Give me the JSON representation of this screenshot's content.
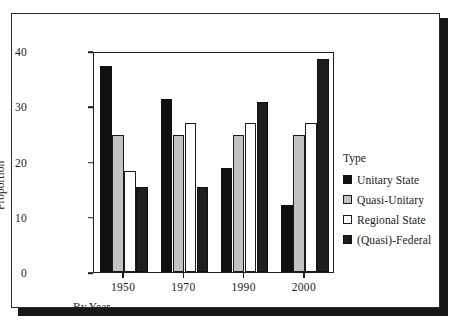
{
  "figure": {
    "frame_color": "#2b2b2b",
    "shadow_color": "#171717",
    "background": "#ffffff"
  },
  "legend": {
    "title": "Type",
    "entries": [
      {
        "label": "Unitary State",
        "color": "#101010",
        "key": "unitary"
      },
      {
        "label": "Quasi-Unitary",
        "color": "#c2c2c2",
        "key": "quasi"
      },
      {
        "label": "Regional State",
        "color": "#ffffff",
        "key": "regional"
      },
      {
        "label": "(Quasi)-Federal",
        "color": "#1e1e1e",
        "key": "federal"
      }
    ]
  },
  "chart_data": {
    "type": "bar",
    "title": "",
    "xlabel": "By Year",
    "ylabel": "Proportion",
    "categories": [
      "1950",
      "1970",
      "1990",
      "2000"
    ],
    "series": [
      {
        "name": "Unitary State",
        "color": "#101010",
        "values": [
          37.3,
          31.4,
          18.8,
          12.2
        ]
      },
      {
        "name": "Quasi-Unitary",
        "color": "#c2c2c2",
        "values": [
          24.8,
          24.8,
          24.8,
          24.8
        ]
      },
      {
        "name": "Regional State",
        "color": "#ffffff",
        "values": [
          18.3,
          27.0,
          27.0,
          27.0
        ]
      },
      {
        "name": "(Quasi)-Federal",
        "color": "#1e1e1e",
        "values": [
          15.4,
          15.4,
          30.7,
          38.5
        ]
      }
    ],
    "ylim": [
      0,
      40
    ],
    "yticks": [
      0,
      10,
      20,
      30,
      40
    ],
    "ytick_labels": [
      "0",
      "10",
      "20",
      "30",
      "40"
    ],
    "xtick_labels": [
      "1950",
      "1970",
      "1990",
      "2000"
    ],
    "grid": false,
    "legend_position": "right"
  }
}
